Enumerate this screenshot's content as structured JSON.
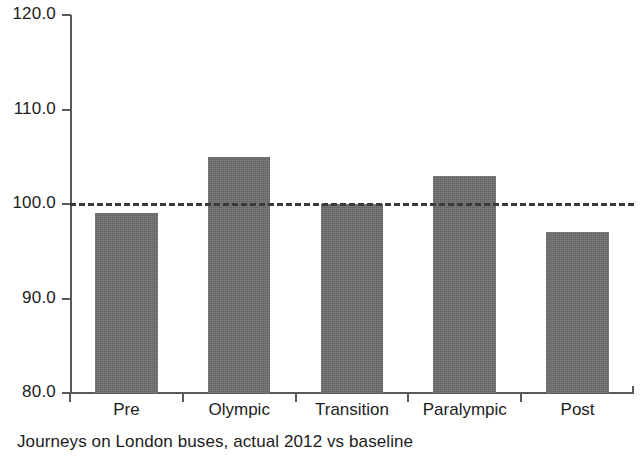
{
  "caption": "Journeys on London buses, actual 2012 vs baseline",
  "chart_data": {
    "type": "bar",
    "title": "",
    "subtitle": "",
    "xlabel": "",
    "ylabel": "",
    "categories": [
      "Pre",
      "Olympic",
      "Transition",
      "Paralympic",
      "Post"
    ],
    "values": [
      99,
      105,
      100,
      103,
      97
    ],
    "series": [
      {
        "name": "Journeys on London buses, actual 2012 vs baseline",
        "values": [
          99,
          105,
          100,
          103,
          97
        ]
      }
    ],
    "ylim": [
      80.0,
      120.0
    ],
    "y_ticks": [
      80.0,
      90.0,
      100.0,
      110.0,
      120.0
    ],
    "y_tick_labels": [
      "80.0",
      "90.0",
      "100.0",
      "110.0",
      "120.0"
    ],
    "grid": false,
    "legend": false,
    "legend_position": "none",
    "annotations": [
      {
        "type": "reference-line",
        "value": 100.0,
        "style": "dashed",
        "label": "baseline"
      }
    ],
    "bar_color": "#6e6e6e",
    "axis_color": "#5a5a5a",
    "baseline_color": "#3a3a3a",
    "background_color": "#ffffff"
  }
}
